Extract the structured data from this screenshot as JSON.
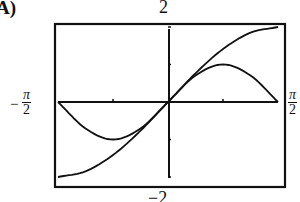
{
  "label": "A)",
  "chart_data": {
    "type": "line",
    "title": "",
    "xlabel": "",
    "ylabel": "",
    "xlim_label": [
      "-π/2",
      "π/2"
    ],
    "xlim": [
      -1.5708,
      1.5708
    ],
    "ylim": [
      -2,
      2
    ],
    "ytick_labels": {
      "top": "2",
      "bottom": "−2"
    },
    "xtick_labels": {
      "left": "−π/2",
      "right": "π/2"
    },
    "x_ticks": [
      -0.7854,
      0.7854
    ],
    "y_ticks": [
      -1,
      1
    ],
    "grid": false,
    "legend": null,
    "series": [
      {
        "name": "2 sin(x)",
        "x": [
          -1.5708,
          -1.1781,
          -0.7854,
          -0.3927,
          0,
          0.3927,
          0.7854,
          1.1781,
          1.5708
        ],
        "values": [
          -2.0,
          -1.848,
          -1.414,
          -0.765,
          0,
          0.765,
          1.414,
          1.848,
          2.0
        ]
      },
      {
        "name": "sin(2x)",
        "x": [
          -1.5708,
          -1.1781,
          -0.7854,
          -0.3927,
          0,
          0.3927,
          0.7854,
          1.1781,
          1.5708
        ],
        "values": [
          0,
          -0.707,
          -1.0,
          -0.707,
          0,
          0.707,
          1.0,
          0.707,
          0
        ]
      }
    ]
  },
  "labels": {
    "choice": "A)",
    "y_max": "2",
    "y_min": "−2",
    "x_min_num": "π",
    "x_min_den": "2",
    "x_min_sign": "−",
    "x_max_num": "π",
    "x_max_den": "2"
  }
}
